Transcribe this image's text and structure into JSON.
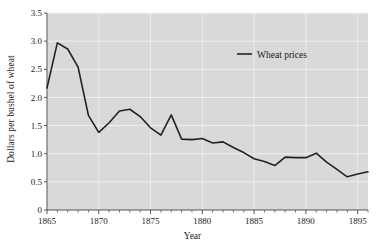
{
  "chart_data": {
    "type": "line",
    "title": "",
    "xlabel": "Year",
    "ylabel": "Dollars per bushel of wheat",
    "xlim": [
      1865,
      1896
    ],
    "ylim": [
      0,
      3.5
    ],
    "grid": true,
    "legend_position": "upper-right-inside",
    "legend_entries": [
      "Wheat prices"
    ],
    "x_major_ticks": [
      1865,
      1870,
      1875,
      1880,
      1885,
      1890,
      1895
    ],
    "x_major_tick_labels": [
      "1865",
      "1870",
      "1875",
      "1880",
      "1885",
      "1890",
      "1895"
    ],
    "x_minor_tick_step": 1,
    "y_major_ticks": [
      0,
      0.5,
      1.0,
      1.5,
      2.0,
      2.5,
      3.0,
      3.5
    ],
    "y_major_tick_labels": [
      "0",
      "0.5",
      "1.0",
      "1.5",
      "2.0",
      "2.5",
      "3.0",
      "3.5"
    ],
    "series": [
      {
        "name": "Wheat prices",
        "color": "#222222",
        "x": [
          1865,
          1866,
          1867,
          1868,
          1869,
          1870,
          1871,
          1872,
          1873,
          1874,
          1875,
          1876,
          1877,
          1878,
          1879,
          1880,
          1881,
          1882,
          1883,
          1884,
          1885,
          1886,
          1887,
          1888,
          1889,
          1890,
          1891,
          1892,
          1893,
          1894,
          1895,
          1896
        ],
        "values": [
          2.17,
          2.97,
          2.86,
          2.54,
          1.68,
          1.38,
          1.55,
          1.76,
          1.79,
          1.66,
          1.46,
          1.33,
          1.69,
          1.26,
          1.25,
          1.27,
          1.19,
          1.21,
          1.11,
          1.02,
          0.91,
          0.86,
          0.79,
          0.94,
          0.93,
          0.93,
          1.01,
          0.85,
          0.72,
          0.59,
          0.64,
          0.68
        ]
      }
    ]
  },
  "axes": {
    "y_title": "Dollars per bushel of wheat",
    "x_title": "Year"
  },
  "legend": {
    "items": [
      {
        "label": "Wheat prices"
      }
    ]
  },
  "style": {
    "plot_background": "#d9d9d9",
    "grid_color": "#f2f2f2",
    "axis_color": "#555555",
    "line_color": "#222222",
    "page_background": "#ffffff"
  }
}
